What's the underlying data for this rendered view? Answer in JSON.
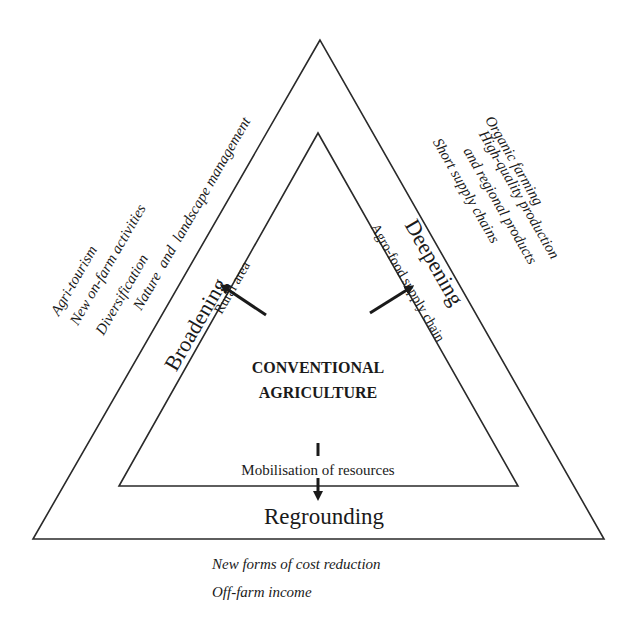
{
  "diagram": {
    "type": "nested-triangle",
    "center": {
      "line1": "CONVENTIONAL",
      "line2": "AGRICULTURE"
    },
    "sides": {
      "broadening": {
        "label": "Broadening",
        "inner_label": "Rural area",
        "activities": [
          "Agri-tourism",
          "New on-farm activities",
          "Diversification",
          "Nature  and  landscape management"
        ]
      },
      "deepening": {
        "label": "Deepening",
        "inner_label": "Agro-food supply chain",
        "activities": [
          "Organic farming",
          "High-quality production",
          "and regional products",
          "Short supply chains"
        ]
      },
      "regrounding": {
        "label": "Regrounding",
        "inner_label": "Mobilisation of resources",
        "activities": [
          "New forms of cost reduction",
          "Off-farm income"
        ]
      }
    },
    "colors": {
      "line": "#2a2a2a",
      "text": "#1a1a1a",
      "background": "#ffffff"
    }
  }
}
